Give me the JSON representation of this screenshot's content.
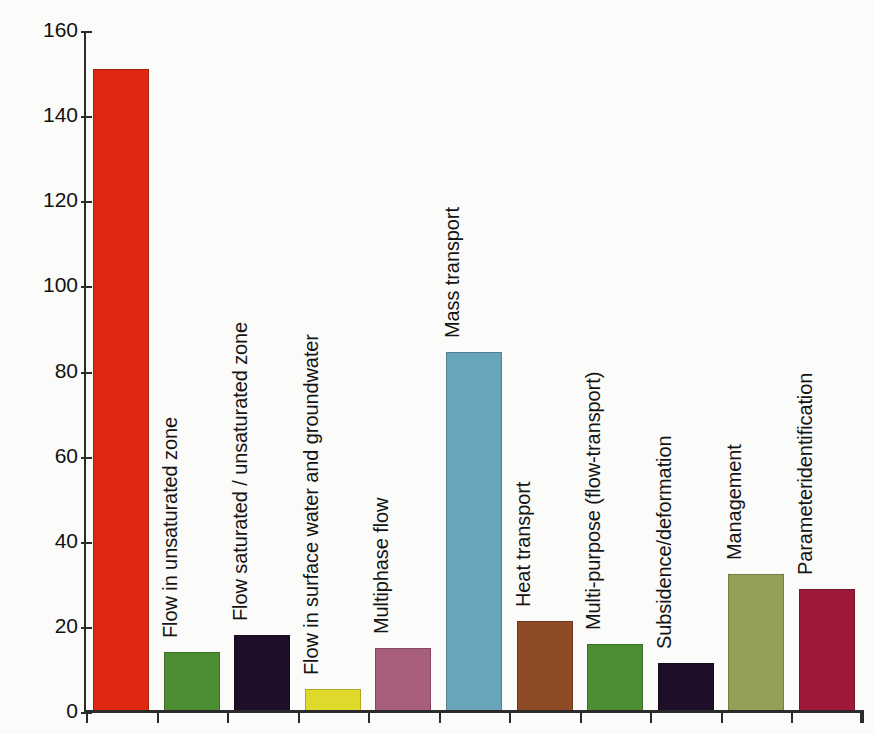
{
  "chart_data": {
    "type": "bar",
    "title": "",
    "xlabel": "",
    "ylabel": "Number of codes in survey",
    "ylim": [
      0,
      160
    ],
    "ytick_values": [
      0,
      20,
      40,
      60,
      80,
      100,
      120,
      140,
      160
    ],
    "ytick_labels": [
      "0",
      "20",
      "40",
      "60",
      "80",
      "100",
      "120",
      "140",
      "160"
    ],
    "grid": false,
    "legend": "none",
    "categories": [
      "Groundwater flow (saturated zone)",
      "Flow in unsaturated zone",
      "Flow saturated / unsaturated zone",
      "Flow in surface water and groundwater",
      "Multiphase flow",
      "Mass transport",
      "Heat transport",
      "Multi-purpose (flow-transport)",
      "Subsidence/deformation",
      "Management",
      "Parameteridentification"
    ],
    "values": [
      151,
      14,
      18,
      5.5,
      15,
      84.5,
      21.5,
      16,
      11.5,
      32.5,
      29
    ],
    "colors": [
      "#DE2910",
      "#4E8E33",
      "#1E0E28",
      "#DFD92B",
      "#A85F7E",
      "#68A5BA",
      "#8E4A25",
      "#4E8E33",
      "#1E0E28",
      "#93A055",
      "#9E1838"
    ],
    "bars": [
      {
        "label": "Groundwater flow",
        "label_line2": "(saturated zone)",
        "label_rotated": false,
        "value": 151,
        "color": "#DE2910"
      },
      {
        "label": "Flow in unsaturated zone",
        "label_rotated": true,
        "value": 14,
        "color": "#4E8E33"
      },
      {
        "label": "Flow saturated / unsaturated zone",
        "label_rotated": true,
        "value": 18,
        "color": "#1E0E28"
      },
      {
        "label": "Flow in surface water and groundwater",
        "label_rotated": true,
        "value": 5.5,
        "color": "#DFD92B"
      },
      {
        "label": "Multiphase flow",
        "label_rotated": true,
        "value": 15,
        "color": "#A85F7E"
      },
      {
        "label": "Mass transport",
        "label_rotated": true,
        "value": 84.5,
        "color": "#68A5BA"
      },
      {
        "label": "Heat transport",
        "label_rotated": true,
        "value": 21.5,
        "color": "#8E4A25"
      },
      {
        "label": "Multi-purpose (flow-transport)",
        "label_rotated": true,
        "value": 16,
        "color": "#4E8E33"
      },
      {
        "label": "Subsidence/deformation",
        "label_rotated": true,
        "value": 11.5,
        "color": "#1E0E28"
      },
      {
        "label": "Management",
        "label_rotated": true,
        "value": 32.5,
        "color": "#93A055"
      },
      {
        "label": "Parameteridentification",
        "label_rotated": true,
        "value": 29,
        "color": "#9E1838"
      }
    ]
  },
  "axis": {
    "y_title": "Number of codes in survey"
  },
  "annotations": {
    "first_bar_caption_line1": "Groundwater flow",
    "first_bar_caption_line2": "(saturated zone)"
  }
}
